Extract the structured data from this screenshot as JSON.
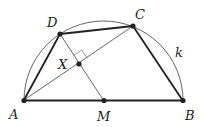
{
  "diagram": {
    "points": {
      "A": {
        "label": "A",
        "x": 24,
        "y": 100
      },
      "B": {
        "label": "B",
        "x": 183,
        "y": 101
      },
      "M": {
        "label": "M",
        "x": 104,
        "y": 101
      },
      "C": {
        "label": "C",
        "x": 133,
        "y": 26
      },
      "D": {
        "label": "D",
        "x": 60,
        "y": 34
      },
      "X": {
        "label": "X",
        "x": 79,
        "y": 64
      }
    },
    "circle_label": "k",
    "colors": {
      "stroke": "#222222",
      "thin": "#555555"
    }
  }
}
